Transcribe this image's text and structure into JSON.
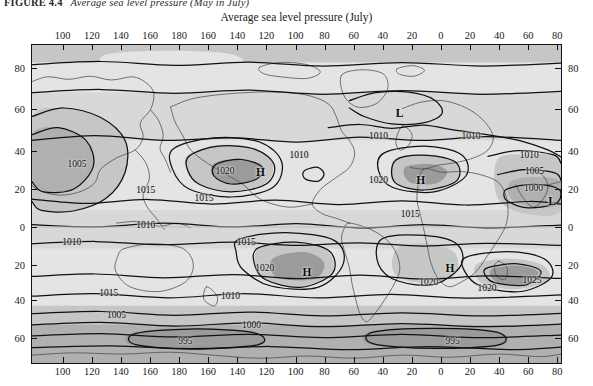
{
  "figure": {
    "caption_label": "FIGURE 4.4",
    "caption_text": "Average sea level pressure (May in July)"
  },
  "chart_data": {
    "type": "map",
    "title": "Average sea level pressure (July)",
    "xlabel": "",
    "ylabel": "",
    "projection": "cylindrical-world",
    "grid": true,
    "legend_position": "none",
    "axis": {
      "x_ticks": [
        100,
        120,
        140,
        160,
        180,
        160,
        140,
        120,
        100,
        80,
        60,
        40,
        20,
        0,
        20,
        40,
        60,
        80
      ],
      "x_tick_positions": [
        0.06,
        0.115,
        0.17,
        0.225,
        0.28,
        0.335,
        0.39,
        0.445,
        0.5,
        0.555,
        0.61,
        0.665,
        0.72,
        0.775,
        0.83,
        0.885,
        0.94,
        0.995
      ],
      "y_ticks": [
        80,
        60,
        40,
        20,
        0,
        20,
        40,
        60
      ],
      "y_tick_positions": [
        0.075,
        0.205,
        0.335,
        0.455,
        0.575,
        0.695,
        0.805,
        0.925
      ],
      "x_range_label": "longitude degrees",
      "y_range_label": "latitude degrees"
    },
    "contour_unit": "millibars",
    "contour_levels": [
      995,
      1000,
      1005,
      1010,
      1015,
      1020,
      1025
    ],
    "contour_labels": [
      {
        "text": "1005",
        "x": 0.085,
        "y": 0.375
      },
      {
        "text": "1015",
        "x": 0.215,
        "y": 0.455
      },
      {
        "text": "1010",
        "x": 0.215,
        "y": 0.565
      },
      {
        "text": "1020",
        "x": 0.365,
        "y": 0.395
      },
      {
        "text": "H",
        "x": 0.432,
        "y": 0.4,
        "type": "high"
      },
      {
        "text": "1010",
        "x": 0.505,
        "y": 0.345
      },
      {
        "text": "1015",
        "x": 0.325,
        "y": 0.48
      },
      {
        "text": "1010",
        "x": 0.655,
        "y": 0.285
      },
      {
        "text": "L",
        "x": 0.695,
        "y": 0.215,
        "type": "low"
      },
      {
        "text": "1020",
        "x": 0.655,
        "y": 0.425
      },
      {
        "text": "H",
        "x": 0.735,
        "y": 0.425,
        "type": "high"
      },
      {
        "text": "1015",
        "x": 0.715,
        "y": 0.53
      },
      {
        "text": "1010",
        "x": 0.83,
        "y": 0.285
      },
      {
        "text": "1010",
        "x": 0.94,
        "y": 0.345
      },
      {
        "text": "1005",
        "x": 0.95,
        "y": 0.395
      },
      {
        "text": "1000",
        "x": 0.948,
        "y": 0.45
      },
      {
        "text": "L",
        "x": 0.983,
        "y": 0.49,
        "type": "low"
      },
      {
        "text": "1015",
        "x": 0.405,
        "y": 0.62
      },
      {
        "text": "1020",
        "x": 0.44,
        "y": 0.7
      },
      {
        "text": "H",
        "x": 0.52,
        "y": 0.715,
        "type": "high"
      },
      {
        "text": "1010",
        "x": 0.075,
        "y": 0.62
      },
      {
        "text": "1015",
        "x": 0.145,
        "y": 0.78
      },
      {
        "text": "1010",
        "x": 0.375,
        "y": 0.79
      },
      {
        "text": "1005",
        "x": 0.16,
        "y": 0.85
      },
      {
        "text": "1000",
        "x": 0.415,
        "y": 0.88
      },
      {
        "text": "995",
        "x": 0.29,
        "y": 0.93
      },
      {
        "text": "H",
        "x": 0.79,
        "y": 0.7,
        "type": "high"
      },
      {
        "text": "1020",
        "x": 0.75,
        "y": 0.745
      },
      {
        "text": "1020",
        "x": 0.86,
        "y": 0.765
      },
      {
        "text": "1025",
        "x": 0.945,
        "y": 0.74
      },
      {
        "text": "995",
        "x": 0.795,
        "y": 0.93
      }
    ],
    "colors": {
      "background": "#d8d8d8",
      "shade_light": "#e4e4e4",
      "shade_mid": "#c6c6c6",
      "shade_dark": "#b0b0b0",
      "shade_darker": "#9b9b9b",
      "contour_line": "#111111",
      "coastline": "#4a4a4a",
      "frame": "#111111"
    }
  }
}
